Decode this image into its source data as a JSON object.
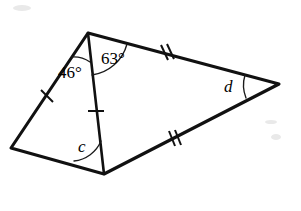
{
  "figure": {
    "kind": "geometry-diagram",
    "background_color": "#ffffff",
    "stroke_color": "#111111",
    "width": 301,
    "height": 211,
    "vertices": {
      "apex": {
        "name": "apex-vertex",
        "x": 88,
        "y": 33
      },
      "left": {
        "name": "left-vertex",
        "x": 11,
        "y": 148
      },
      "bottom": {
        "name": "bottom-vertex",
        "x": 104,
        "y": 174
      },
      "right": {
        "name": "right-vertex",
        "x": 279,
        "y": 84
      }
    },
    "edges": [
      {
        "name": "edge-apex-left",
        "from": "apex",
        "to": "left",
        "ticks": 1
      },
      {
        "name": "edge-left-bottom",
        "from": "left",
        "to": "bottom",
        "ticks": 0
      },
      {
        "name": "edge-apex-right",
        "from": "apex",
        "to": "right",
        "ticks": 2
      },
      {
        "name": "edge-bottom-right",
        "from": "bottom",
        "to": "right",
        "ticks": 2
      },
      {
        "name": "edge-apex-bottom",
        "from": "apex",
        "to": "bottom",
        "ticks": 1
      }
    ],
    "labels": {
      "angle_46": "46°",
      "angle_63": "63°",
      "angle_c": "c",
      "angle_d": "d"
    },
    "angle_marks": [
      {
        "name": "arc-angle-46",
        "at": "apex",
        "label": "46°"
      },
      {
        "name": "arc-angle-63",
        "at": "apex",
        "label": "63°"
      },
      {
        "name": "arc-angle-c",
        "at": "bottom",
        "label": "c"
      },
      {
        "name": "arc-angle-d",
        "at": "right",
        "label": "d"
      }
    ],
    "tick_marks": [
      {
        "name": "tick-single-left",
        "edge": "edge-apex-left",
        "count": 1,
        "x": 47,
        "y": 96
      },
      {
        "name": "tick-single-cevian",
        "edge": "edge-apex-bottom",
        "count": 1,
        "x": 96,
        "y": 111
      },
      {
        "name": "tick-double-upper",
        "edge": "edge-apex-right",
        "count": 2,
        "x": 167,
        "y": 52
      },
      {
        "name": "tick-double-lower",
        "edge": "edge-bottom-right",
        "count": 2,
        "x": 175,
        "y": 138
      }
    ]
  }
}
